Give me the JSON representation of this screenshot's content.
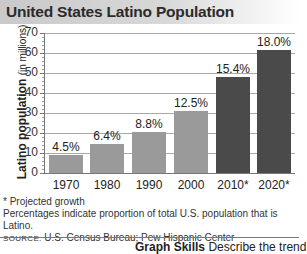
{
  "title": "United States Latino Population",
  "chart_data": {
    "type": "bar",
    "title": "United States Latino Population",
    "xlabel": "",
    "ylabel": "Latino population (in millions)",
    "ylabel_main": "Latino population",
    "ylabel_unit": "(in millions)",
    "ylim": [
      0,
      70
    ],
    "yticks": [
      0,
      10,
      20,
      30,
      40,
      50,
      60,
      70
    ],
    "grid": true,
    "categories": [
      "1970",
      "1980",
      "1990",
      "2000",
      "2010*",
      "2020*"
    ],
    "values": [
      9,
      14.6,
      20.5,
      31,
      48,
      61.5
    ],
    "data_labels": [
      "4.5%",
      "6.4%",
      "8.8%",
      "12.5%",
      "15.4%",
      "18.0%"
    ],
    "projected": [
      false,
      false,
      false,
      false,
      true,
      true
    ],
    "colors": {
      "actual": "#9a9a9a",
      "projected": "#4a4a4a"
    }
  },
  "notes": {
    "projected": "* Projected growth",
    "percentages": "Percentages indicate proportion of total U.S. population that is Latino.",
    "source_prefix": "SOURCE:",
    "source": "U.S. Census Bureau; Pew Hispanic Center"
  },
  "footer": {
    "skills_label": "Graph Skills",
    "skills_text": "Describe the trend"
  }
}
